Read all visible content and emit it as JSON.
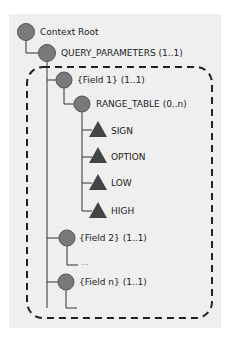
{
  "diagram": {
    "root": {
      "label": "Context Root",
      "shape": "circle"
    },
    "query_parameters": {
      "label": "QUERY_PARAMETERS (1..1)",
      "shape": "circle"
    },
    "field_1": {
      "label": "{Field 1} (1..1)",
      "shape": "circle"
    },
    "range_table": {
      "label": "RANGE_TABLE (0..n)",
      "shape": "circle"
    },
    "range_fields": [
      {
        "label": "SIGN",
        "shape": "triangle"
      },
      {
        "label": "OPTION",
        "shape": "triangle"
      },
      {
        "label": "LOW",
        "shape": "triangle"
      },
      {
        "label": "HIGH",
        "shape": "triangle"
      }
    ],
    "field_2": {
      "label": "{Field 2} (1..1)",
      "shape": "circle"
    },
    "ellipsis": {
      "label": "..."
    },
    "field_n": {
      "label": "{Field n} (1..1)",
      "shape": "circle"
    }
  },
  "colors": {
    "panel": "#efefef",
    "node_fill": "#7a7a7a",
    "node_stroke": "#555555",
    "triangle_fill": "#444444",
    "line": "#333333"
  }
}
